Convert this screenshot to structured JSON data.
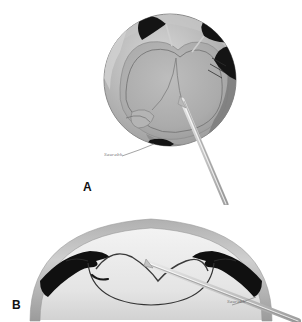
{
  "figure": {
    "background_color": "#ffffff",
    "panels": [
      {
        "id": "A",
        "letter": "A",
        "view": "en-face (surgeon's view) of the cornea and lens capsule",
        "description": "Circular cornea seen from the front with dark wedge-shaped iris/capsule segments at the periphery and a cannula entering from the lower right"
      },
      {
        "id": "B",
        "letter": "B",
        "view": "cross-section of the anterior segment",
        "description": "Sagittal section of the anterior eye showing cornea dome, dark triangular iris profiles on each side, lens capsule and a cannula passing through"
      }
    ],
    "signature": "Saurabh",
    "colors": {
      "paper": "#ffffff",
      "cornea_light": "#e9e9e9",
      "lens_mid": "#a8a8a8",
      "lens_dark": "#8d8d8d",
      "tissue_shadow": "#6f6f6f",
      "iris_black": "#121212",
      "cannula": "#c9c9c9",
      "cannula_edge": "#9a9a9a",
      "outline": "#4a4a4a",
      "letter_color": "#111111",
      "signature_color": "#5a5a5a"
    }
  },
  "panel_a": {
    "letter": "A",
    "signature": "Saurabh",
    "circle": {
      "cx": 170,
      "cy": 80,
      "r": 66
    },
    "cannula": {
      "label": "cannula",
      "from_x": 186,
      "from_y": 104,
      "to_x": 222,
      "to_y": 205
    },
    "dark_segments_count": 4
  },
  "panel_b": {
    "letter": "B",
    "signature": "Saurabh",
    "cannula": {
      "label": "cannula",
      "from_x": 155,
      "from_y": 263,
      "to_x": 290,
      "to_y": 320
    },
    "iris_profiles_count": 2
  }
}
